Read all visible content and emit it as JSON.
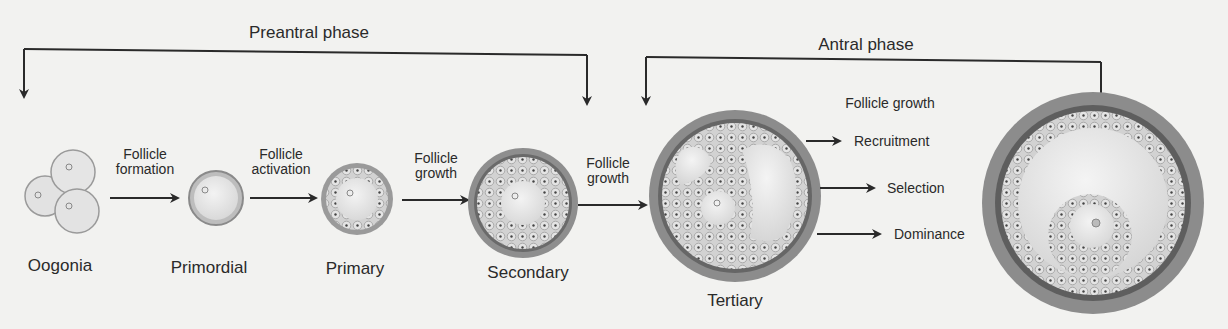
{
  "phases": {
    "preantral": "Preantral phase",
    "antral": "Antral phase"
  },
  "stages": [
    {
      "name": "Oogonia"
    },
    {
      "name": "Primordial"
    },
    {
      "name": "Primary"
    },
    {
      "name": "Secondary"
    },
    {
      "name": "Tertiary"
    }
  ],
  "transitions": [
    {
      "line1": "Follicle",
      "line2": "formation"
    },
    {
      "line1": "Follicle",
      "line2": "activation"
    },
    {
      "line1": "Follicle",
      "line2": "growth"
    },
    {
      "line1": "Follicle",
      "line2": "growth"
    }
  ],
  "antral_process": {
    "title": "Follicle growth",
    "steps": [
      "Recruitment",
      "Selection",
      "Dominance"
    ]
  },
  "colors": {
    "background": "#f2f2f0",
    "line": "#2a2a2a",
    "theca": "#8e8e8e",
    "basement": "#6a6a6a",
    "granulosa": "#cfcfcf",
    "oocyte": "#e6e6e6",
    "antrum": "#e9e9e9"
  }
}
